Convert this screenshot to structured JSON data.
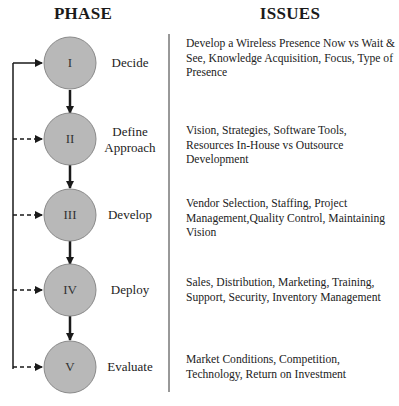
{
  "headers": {
    "phase": "PHASE",
    "issues": "ISSUES"
  },
  "colors": {
    "circle_fill": "#b8b8b8",
    "circle_stroke": "#8a8a8a",
    "line": "#1a1a1a",
    "divider": "#333333"
  },
  "phases": [
    {
      "numeral": "I",
      "name": "Decide",
      "issues": "Develop a Wireless Presence Now vs Wait & See, Knowledge Acquisition, Focus, Type of Presence"
    },
    {
      "numeral": "II",
      "name": "Define Approach",
      "issues": "Vision, Strategies, Software Tools, Resources In-House vs Outsource Development"
    },
    {
      "numeral": "III",
      "name": "Develop",
      "issues": "Vendor Selection, Staffing, Project Management,Quality Control, Maintaining Vision"
    },
    {
      "numeral": "IV",
      "name": "Deploy",
      "issues": "Sales, Distribution, Marketing, Training, Support, Security, Inventory Management"
    },
    {
      "numeral": "V",
      "name": "Evaluate",
      "issues": "Market Conditions, Competition, Technology, Return on Investment"
    }
  ]
}
